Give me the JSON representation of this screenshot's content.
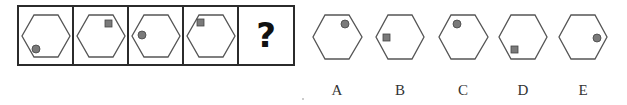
{
  "puzzle": {
    "question_mark": "?",
    "colors": {
      "outline": "#555555",
      "frame": "#2b2b2b",
      "marker_fill": "#7a7a7a",
      "marker_stroke": "#444444"
    },
    "sequence": [
      {
        "shape": "hexagon",
        "marker": "circle",
        "marker_position": "bottom-left"
      },
      {
        "shape": "hexagon",
        "marker": "square",
        "marker_position": "top-right"
      },
      {
        "shape": "hexagon",
        "marker": "circle",
        "marker_position": "left"
      },
      {
        "shape": "hexagon",
        "marker": "square",
        "marker_position": "top-left"
      },
      {
        "shape": "unknown",
        "marker": "question-mark",
        "marker_position": "center"
      }
    ],
    "options": [
      {
        "label": "A",
        "marker": "circle",
        "marker_position": "top-right"
      },
      {
        "label": "B",
        "marker": "square",
        "marker_position": "left"
      },
      {
        "label": "C",
        "marker": "circle",
        "marker_position": "top-left"
      },
      {
        "label": "D",
        "marker": "square",
        "marker_position": "bottom-left"
      },
      {
        "label": "E",
        "marker": "circle",
        "marker_position": "right"
      }
    ]
  }
}
